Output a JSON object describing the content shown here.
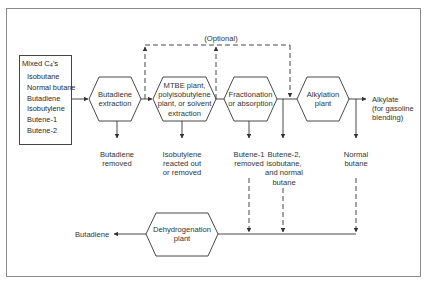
{
  "diagram": {
    "type": "process-flow",
    "feed": {
      "title": "Mixed C",
      "title_sub": "4",
      "title_suffix": "'s",
      "components": [
        "Isobutane",
        "Normal butane",
        "Butadiene",
        "Isobutylene",
        "Butene-1",
        "Butene-2"
      ]
    },
    "units": [
      {
        "id": "butadiene-extraction",
        "lines": [
          "Butadiene",
          "extraction"
        ]
      },
      {
        "id": "mtbe-plant",
        "lines": [
          "MTBE plant,",
          "polyisobutylene",
          "plant, or solvent",
          "extraction"
        ]
      },
      {
        "id": "fractionation",
        "lines": [
          "Fractionation",
          "or absorption"
        ]
      },
      {
        "id": "alkylation-plant",
        "lines": [
          "Alkylation",
          "plant"
        ]
      },
      {
        "id": "dehydrogenation-plant",
        "lines": [
          "Dehydrogenation",
          "plant"
        ]
      }
    ],
    "optional_label": "(Optional)",
    "outputs": {
      "butadiene_removed": [
        "Butadiene",
        "removed"
      ],
      "isobutylene_removed": [
        "Isobutylene",
        "reacted out",
        "or removed"
      ],
      "butene1_removed": [
        "Butene-1",
        "removed"
      ],
      "butene2_mix": [
        "Butene-2,",
        "isobutane,",
        "and normal",
        "butane"
      ],
      "normal_butane": [
        "Normal",
        "butane"
      ],
      "alkylate": [
        "Alkylate",
        "(for gasoline",
        "blending)"
      ],
      "butadiene_product": "Butadiene"
    },
    "colors": {
      "line": "#333333",
      "frame": "#8a8a8a",
      "background": "#ffffff"
    }
  }
}
